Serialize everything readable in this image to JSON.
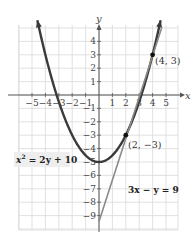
{
  "chart_data": {
    "type": "line",
    "title": "",
    "xlabel": "x",
    "ylabel": "y",
    "xlim": [
      -5.5,
      5.5
    ],
    "ylim": [
      -10,
      5
    ],
    "grid": true,
    "x_ticks": [
      -5,
      -4,
      -3,
      -2,
      -1,
      1,
      2,
      3,
      4,
      5
    ],
    "x_tick_labels": [
      "−5",
      "−4",
      "−3",
      "−2",
      "−1",
      "1",
      "2",
      "3",
      "4",
      "5"
    ],
    "y_ticks": [
      4,
      3,
      2,
      1,
      -1,
      -2,
      -3,
      -4,
      -5,
      -6,
      -7,
      -8,
      -9
    ],
    "y_tick_labels": [
      "4",
      "3",
      "2",
      "1",
      "−1",
      "−2",
      "−3",
      "−4",
      "−5",
      "−6",
      "−7",
      "−8",
      "−9"
    ],
    "series": [
      {
        "name": "x² = 2y + 10",
        "kind": "parabola",
        "equation": "y = x^2/2 - 5",
        "x_range": [
          -4.6,
          4.6
        ],
        "color": "#3a3a3a",
        "vertex": [
          0,
          -5
        ]
      },
      {
        "name": "3x − y = 9",
        "kind": "line",
        "equation": "y = 3x - 9",
        "x_range": [
          0,
          4.7
        ],
        "color": "#8a8a8a"
      }
    ],
    "points": [
      {
        "x": 4,
        "y": 3,
        "label": "(4, 3)"
      },
      {
        "x": 2,
        "y": -3,
        "label": "(2, −3)"
      }
    ],
    "annotations": [
      {
        "text": "x² = 2y + 10",
        "position": "left-middle"
      },
      {
        "text": "3x − y = 9",
        "position": "right-lower"
      }
    ]
  },
  "labels": {
    "x_axis": "x",
    "y_axis": "y",
    "point_a": "(4, 3)",
    "point_b": "(2, −3)",
    "parabola_eq_base": "x",
    "parabola_eq_exp": "2",
    "parabola_eq_rest": " = 2y + 10",
    "line_eq": "3x − y = 9"
  }
}
